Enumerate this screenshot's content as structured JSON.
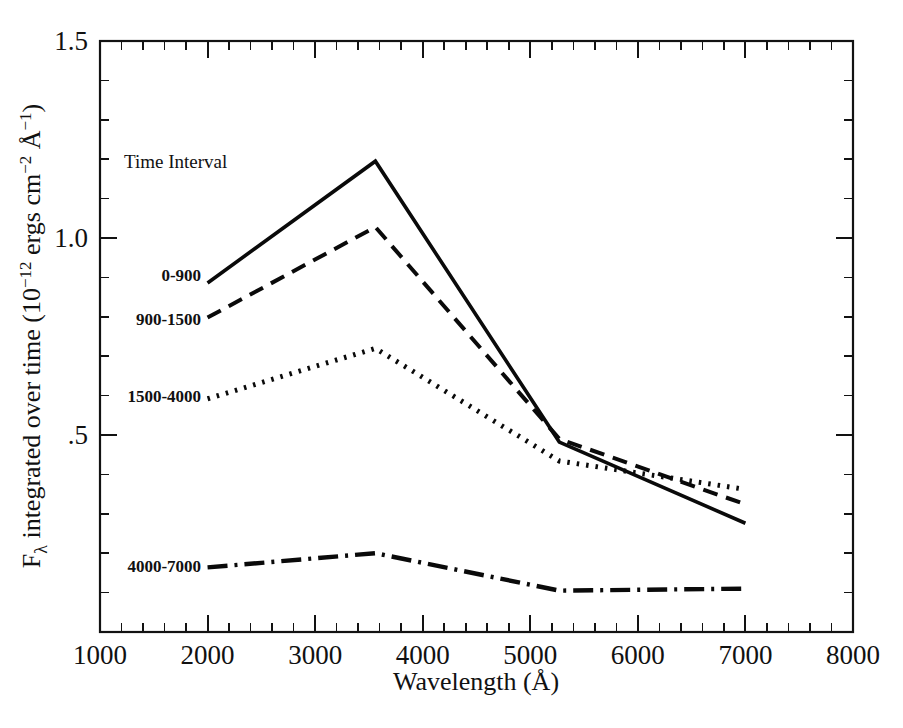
{
  "chart_data": {
    "type": "line",
    "title": "",
    "xlabel": "Wavelength (Å)",
    "ylabel": "Fλ integrated over time (10⁻¹² ergs cm⁻² Å⁻¹)",
    "ylabel_parts": {
      "prefix": "F",
      "sub": "λ",
      "mid": " integrated over time (10",
      "exp1": "−12",
      "mid2": " ergs cm",
      "exp2": "−2",
      "mid3": " Å",
      "exp3": "−1",
      "suffix": ")"
    },
    "xlim": [
      1000,
      8000
    ],
    "ylim": [
      0,
      1.5
    ],
    "grid": false,
    "legend_position": "upper-left-inline",
    "legend_title": "Time Interval",
    "xticks": [
      1000,
      2000,
      3000,
      4000,
      5000,
      6000,
      7000,
      8000
    ],
    "xtick_labels": [
      "1000",
      "2000",
      "3000",
      "4000",
      "5000",
      "6000",
      "7000",
      "8000"
    ],
    "x_minor_step": 200,
    "yticks": [
      0.5,
      1.0,
      1.5
    ],
    "ytick_labels": [
      ".5",
      "1.0",
      "1.5"
    ],
    "y_minor_step": 0.1,
    "series": [
      {
        "name": "0-900",
        "dash_style": "solid",
        "dasharray": "",
        "stroke_width": 3.6,
        "label_x": 1940,
        "label_y": 0.905,
        "x": [
          2000,
          3560,
          5270,
          7000
        ],
        "values": [
          0.886,
          1.195,
          0.482,
          0.276
        ]
      },
      {
        "name": "900-1500",
        "dash_style": "dashed",
        "dasharray": "15,9",
        "stroke_width": 4.0,
        "label_x": 1940,
        "label_y": 0.795,
        "x": [
          2000,
          3560,
          5270,
          7000
        ],
        "values": [
          0.798,
          1.028,
          0.49,
          0.324
        ]
      },
      {
        "name": "1500-4000",
        "dash_style": "dotted",
        "dasharray": "2.5,7",
        "stroke_width": 5.0,
        "label_x": 1940,
        "label_y": 0.598,
        "x": [
          2000,
          3560,
          5270,
          7000
        ],
        "values": [
          0.592,
          0.72,
          0.434,
          0.362
        ]
      },
      {
        "name": "4000-7000",
        "dash_style": "dashdot",
        "dasharray": "20,7,3,7",
        "stroke_width": 4.4,
        "label_x": 1940,
        "label_y": 0.168,
        "x": [
          2000,
          3560,
          5270,
          7000
        ],
        "values": [
          0.164,
          0.2,
          0.105,
          0.11
        ]
      }
    ]
  },
  "caption": {
    "text": ""
  }
}
